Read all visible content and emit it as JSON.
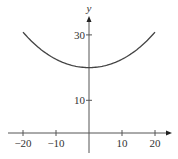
{
  "chart_data": {
    "type": "line",
    "title": "",
    "xlabel": "x",
    "ylabel": "y",
    "xlim": [
      -22,
      22
    ],
    "ylim": [
      0,
      34
    ],
    "x_ticks": [
      -20,
      -10,
      10,
      20
    ],
    "x_tick_labels": [
      "−20",
      "−10",
      "10",
      "20"
    ],
    "y_ticks": [
      10,
      30
    ],
    "y_tick_labels": [
      "10",
      "30"
    ],
    "grid": false,
    "series": [
      {
        "name": "y = 20 cosh(x/20)",
        "x": [
          -20,
          -15,
          -10,
          -5,
          0,
          5,
          10,
          15,
          20
        ],
        "values": [
          30.9,
          25.9,
          22.6,
          20.6,
          20.0,
          20.6,
          22.6,
          25.9,
          30.9
        ]
      }
    ]
  },
  "colors": {
    "axis": "#555555",
    "curve": "#444444"
  }
}
